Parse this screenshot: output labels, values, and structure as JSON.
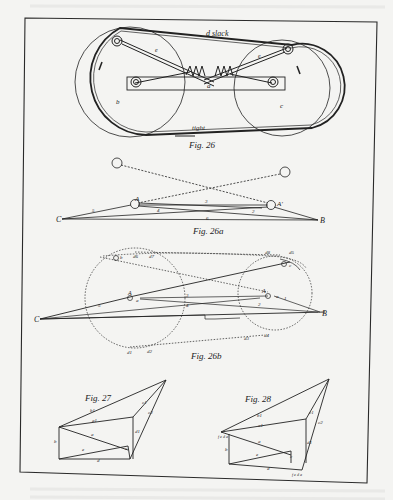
{
  "page": {
    "type": "scanned-book-page",
    "background": "#f4f4f2",
    "ink": "#222222",
    "bleed_text_color": "#d8d8d6"
  },
  "figures": [
    {
      "id": "fig26",
      "caption": "Fig. 26",
      "labels": {
        "top_belt": "d slack",
        "bottom_belt": "tight",
        "bar": "a",
        "left_pulley": "b",
        "right_pulley": "c",
        "left_rod": "e",
        "right_rod": "e"
      }
    },
    {
      "id": "fig26a",
      "caption": "Fig. 26a",
      "labels": {
        "left_point": "C",
        "right_point": "B",
        "left_pivot": "A",
        "right_pivot": "A'",
        "seg_upper": "3",
        "seg_mid": "4",
        "seg_lower": "6",
        "seg_right": "2",
        "seg_left": "5"
      }
    },
    {
      "id": "fig26b",
      "caption": "Fig. 26b",
      "labels": {
        "left_point": "C",
        "right_point": "B",
        "left_pivot": "A",
        "right_pivot": "A",
        "pivot_a_left": "a",
        "pivot_a_right": "a",
        "top_left_b": "b",
        "top_right_c": "c",
        "d6": "d6",
        "d7": "d7",
        "d8": "d8",
        "d5": "d5",
        "d1": "d1",
        "d2": "d2",
        "d3": "d3",
        "d4": "d4",
        "seg3": "3",
        "seg4": "4",
        "seg2": "2",
        "seg1": "1",
        "seg5": "5"
      }
    },
    {
      "id": "fig27",
      "caption": "Fig. 27",
      "labels": {
        "b1": "b1",
        "a1": "a1",
        "a": "a",
        "e": "e",
        "b": "b",
        "c": "c",
        "d1": "d1",
        "c1": "c1",
        "c2": "c2",
        "d": "d",
        "ab": "ab"
      }
    },
    {
      "id": "fig28",
      "caption": "Fig. 28",
      "labels": {
        "b1": "b1",
        "a1": "a1",
        "a": "a",
        "e": "e",
        "b": "b",
        "c": "c",
        "d1": "d1",
        "c1": "c1",
        "c2": "c2",
        "d": "d",
        "left_tag": "f e d a",
        "bottom_tag": "f e d a"
      }
    }
  ]
}
